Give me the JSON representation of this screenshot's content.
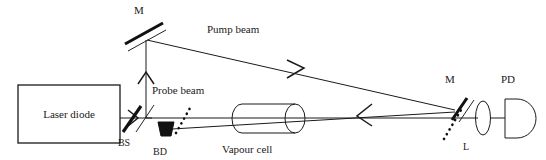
{
  "figure": {
    "background_color": "#ffffff",
    "line_color": "#1a1a1a",
    "width": 546,
    "height": 160
  },
  "components": {
    "laser_diode": {
      "label": "Laser diode",
      "shape": "rectangle",
      "x": 18,
      "y": 85,
      "w": 102,
      "h": 58
    },
    "beam_splitter": {
      "label": "BS",
      "shape": "tilted-line",
      "label_x": 124,
      "label_y": 136
    },
    "beam_dump": {
      "label": "BD",
      "shape": "filled-trapezoid",
      "label_x": 157,
      "label_y": 148
    },
    "mirror_top": {
      "label": "M",
      "shape": "mirror",
      "label_x": 139,
      "label_y": 14
    },
    "mirror_right": {
      "label": "M",
      "shape": "mirror",
      "label_x": 450,
      "label_y": 83
    },
    "lens": {
      "label": "L",
      "shape": "ellipse",
      "label_x": 467,
      "label_y": 148
    },
    "photodetector": {
      "label": "PD",
      "shape": "d-shape",
      "label_x": 508,
      "label_y": 83
    },
    "vapour_cell": {
      "label": "Vapour cell",
      "shape": "cylinder",
      "label_x": 222,
      "label_y": 149
    }
  },
  "beams": {
    "pump": {
      "label": "Pump beam",
      "label_x": 207,
      "label_y": 33,
      "arrow_direction": "right-down"
    },
    "probe": {
      "label": "Probe beam",
      "label_x": 152,
      "label_y": 94,
      "arrow_direction": "right"
    }
  },
  "labels_list": [
    "M",
    "Pump beam",
    "M",
    "PD",
    "Laser diode",
    "Probe beam",
    "BS",
    "BD",
    "Vapour cell",
    "L"
  ]
}
